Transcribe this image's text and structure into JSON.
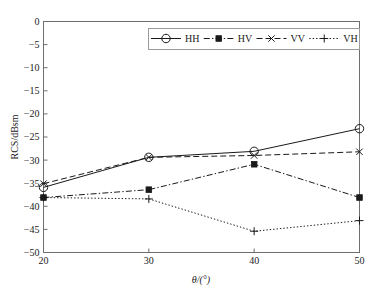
{
  "chart_data": {
    "type": "line",
    "title": "",
    "xlabel": "θ/(°)",
    "ylabel": "RCS/dBsm",
    "x": [
      20,
      30,
      40,
      50
    ],
    "xticklabels": [
      "20",
      "30",
      "40",
      "50"
    ],
    "xlim": [
      20,
      50
    ],
    "ylim": [
      -50,
      0
    ],
    "yticks": [
      0,
      -5,
      -10,
      -15,
      -20,
      -25,
      -30,
      -35,
      -40,
      -45,
      -50
    ],
    "yticklabels": [
      "0",
      "−5",
      "−10",
      "−15",
      "−20",
      "−25",
      "−30",
      "−35",
      "−40",
      "−45",
      "−50"
    ],
    "grid": false,
    "legend_position": "top-center",
    "series": [
      {
        "name": "HH",
        "values": [
          -35.9,
          -29.4,
          -28.1,
          -23.2
        ],
        "linestyle": "solid",
        "marker": "circle",
        "color": "#1a1a1a"
      },
      {
        "name": "HV",
        "values": [
          -38.1,
          -36.4,
          -30.9,
          -38.1
        ],
        "linestyle": "dash-dot",
        "marker": "square",
        "color": "#1a1a1a"
      },
      {
        "name": "VV",
        "values": [
          -35.1,
          -29.4,
          -29.0,
          -28.2
        ],
        "linestyle": "dashed",
        "marker": "x",
        "color": "#1a1a1a"
      },
      {
        "name": "VH",
        "values": [
          -38.1,
          -38.4,
          -45.4,
          -43.1
        ],
        "linestyle": "dotted",
        "marker": "plus",
        "color": "#1a1a1a"
      }
    ]
  },
  "legend": {
    "entries": [
      {
        "label": "HH"
      },
      {
        "label": "HV"
      },
      {
        "label": "VV"
      },
      {
        "label": "VH"
      }
    ]
  },
  "axes": {
    "x_title": "θ/(°)",
    "y_title": "RCS/dBsm"
  },
  "colors": {
    "foreground": "#1a1a1a",
    "axis": "#6e6e6e",
    "background": "#ffffff",
    "legend_border": "#9a9a9a"
  }
}
